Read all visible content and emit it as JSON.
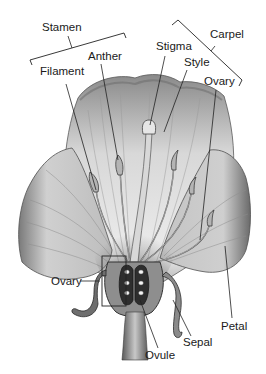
{
  "diagram": {
    "type": "labeled-illustration",
    "groups": [
      {
        "label": "Stamen",
        "members": [
          "Anther",
          "Filament"
        ]
      },
      {
        "label": "Carpel",
        "members": [
          "Stigma",
          "Style",
          "Ovary"
        ]
      }
    ],
    "labels": {
      "stamen": "Stamen",
      "anther": "Anther",
      "filament": "Filament",
      "stigma": "Stigma",
      "style": "Style",
      "carpel": "Carpel",
      "ovary_top": "Ovary",
      "ovary_left": "Ovary",
      "ovule": "Ovule",
      "sepal": "Sepal",
      "petal": "Petal"
    },
    "colors": {
      "background": "#ffffff",
      "petal_light": "#e6e6e6",
      "petal_mid": "#b8b8b8",
      "petal_dark": "#6e6e6e",
      "line": "#222222",
      "ovule": "#f4f4f4"
    }
  }
}
